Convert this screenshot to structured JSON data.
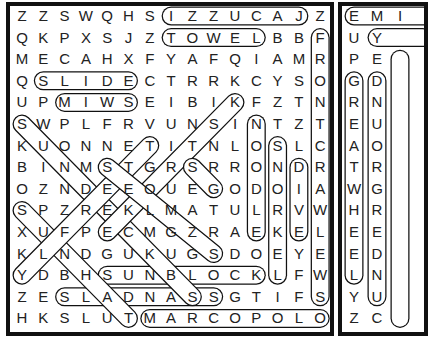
{
  "puzzle_left": {
    "rows": [
      "ZZSWQHSIZZUCAJZ",
      "QKPXSJZTOWELBBF",
      "MECAHXFYAFQIAMR",
      "QSLIDECTRRKCYSO",
      "UPMIWSEIBIKFZTN",
      "SWPLFRVUNSINTZT",
      "KUONNETITNLOSLC",
      "BINMSTGRSRRONDR",
      "OZNDEEOUEGODOIA",
      "SPZREKLMATULRVW",
      "XUFPECMGZRAEKEL",
      "KLNDGUKUGSDOEYE",
      "YDBHSUNBLOCKLFW",
      "ZESLADNASSGTIFS",
      "HKSLUTMARCOPOLO"
    ]
  },
  "puzzle_right": {
    "rows": [
      "EMI",
      "UY ",
      "PE ",
      "GD ",
      "RN ",
      "EU ",
      "AO ",
      "TR ",
      "WG ",
      "HR ",
      "EE ",
      "ED ",
      "LN ",
      "YU ",
      "ZC "
    ]
  },
  "found_words": [
    "IZZUCAJ",
    "TOWEL",
    "SLIDE",
    "MIWS",
    "SUNBLOCK",
    "SLADNAS",
    "MARCOPOLO",
    "GREATWHEEL",
    "DNUORGREDNU",
    "NOODLE",
    "SNORKEL",
    "DIVE",
    "FRONT"
  ]
}
